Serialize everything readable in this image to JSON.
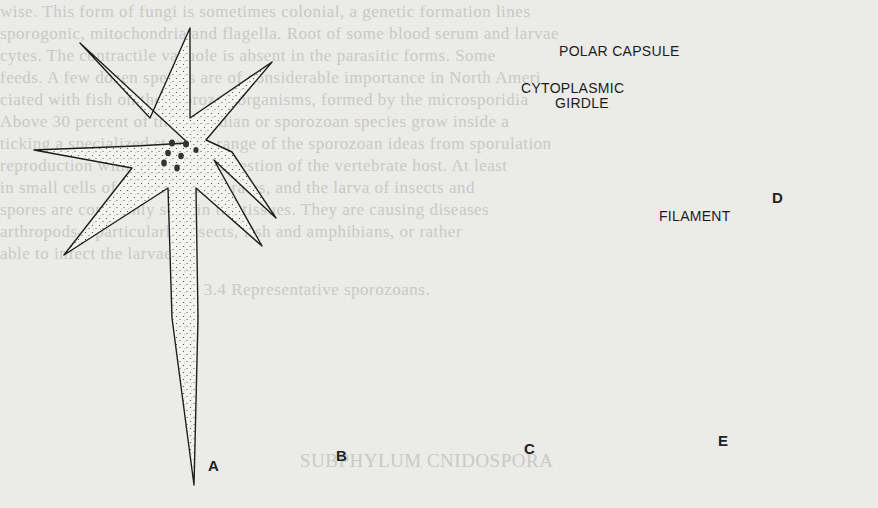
{
  "figure": {
    "panels": [
      {
        "id": "A",
        "label": "A",
        "description": "stellate amoeboid cell with radiating pseudopodia and long tail process"
      },
      {
        "id": "B",
        "label": "B",
        "description": "elongated spindle-shaped cell with stippled cytoplasm and several nuclei"
      },
      {
        "id": "C",
        "label": "C",
        "description": "large pear-shaped cell with reticulate cytoplasm, dark apical cap and prominent nucleus"
      },
      {
        "id": "D",
        "label": "D",
        "description": "spore with polar capsule, coiled filament and cytoplasmic girdle"
      },
      {
        "id": "E",
        "label": "E",
        "description": "insect larva (caterpillar), lateral view"
      }
    ],
    "callouts": {
      "polar_capsule": "POLAR CAPSULE",
      "cytoplasmic_girdle_line1": "CYTOPLASMIC",
      "cytoplasmic_girdle_line2": "GIRDLE",
      "filament": "FILAMENT"
    }
  },
  "bleed_through_text": {
    "line_1": "wise. This form of fungi is sometimes colonial, a genetic formation lines",
    "line_2": "sporogonic, mitochondria and flagella. Root of some blood serum and larvae",
    "line_3": "cytes. The contractile vacuole is absent in the parasitic forms. Some",
    "line_4": "feeds. A few dozen species are of considerable importance in North Ameri",
    "line_5": "ciated with fish on the sporozoa organisms, formed by the microsporidia",
    "line_6": "Above 30 percent of the coccidian or sporozoan species grow inside a",
    "line_7": "ticking a specialized stage. A range of the sporozoan ideas from sporulation",
    "line_8": "reproduction with occasional digestion of the vertebrate host. At least",
    "line_9": "in small cells of all the invertebrates, and the larva of insects and",
    "line_10": "spores are commonly seen in the tissues. They are causing diseases",
    "line_11": "arthropods—particularly insects, fish and amphibians, or rather",
    "line_12": "able to infect the larvae.",
    "line_13": "Fig. 3.4 Representative sporozoans.",
    "heading": "SUBPHYLUM CNIDOSPORA"
  },
  "colors": {
    "paper": "#ebebe8",
    "ink": "#1e1e1e",
    "bleed_ink": "#c9c9c5",
    "stipple": "#3a3a3a"
  }
}
